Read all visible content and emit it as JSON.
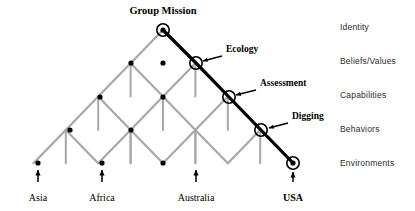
{
  "figure": {
    "type": "lattice-diagram",
    "title": "Group Mission",
    "colors": {
      "lattice": "#a8a8a8",
      "path": "#000000",
      "node": "#000000",
      "text": "#000000",
      "side_text": "#2b2b2b",
      "background": "#ffffff"
    }
  },
  "apex": {
    "label": "Group Mission",
    "x": 163,
    "y": 30
  },
  "levels": [
    {
      "name": "Identity",
      "y": 30
    },
    {
      "name": "Beliefs/Values",
      "y": 63
    },
    {
      "name": "Capabilities",
      "y": 97
    },
    {
      "name": "Behaviors",
      "y": 130
    },
    {
      "name": "Environments",
      "y": 163
    }
  ],
  "side_labels": [
    {
      "text": "Identity",
      "x": 340,
      "y": 22
    },
    {
      "text": "Beliefs/Values",
      "x": 340,
      "y": 56
    },
    {
      "text": "Capabilities",
      "x": 340,
      "y": 90
    },
    {
      "text": "Behaviors",
      "x": 340,
      "y": 124
    },
    {
      "text": "Environments",
      "x": 340,
      "y": 158
    }
  ],
  "bottom_labels": [
    {
      "text": "Asia",
      "x": 38,
      "y": 192,
      "bold": false,
      "arrow_x": 38,
      "arrow_top": 170,
      "arrow_bottom": 182
    },
    {
      "text": "Africa",
      "x": 102,
      "y": 192,
      "bold": false,
      "arrow_x": 102,
      "arrow_top": 170,
      "arrow_bottom": 182
    },
    {
      "text": "Australia",
      "x": 196,
      "y": 192,
      "bold": false,
      "arrow_x": 196,
      "arrow_top": 170,
      "arrow_bottom": 182
    },
    {
      "text": "USA",
      "x": 293,
      "y": 192,
      "bold": true,
      "arrow_x": 293,
      "arrow_top": 172,
      "arrow_bottom": 182
    }
  ],
  "path_nodes": [
    {
      "label": "Group Mission",
      "x": 163,
      "y": 30,
      "circled": true,
      "dot": true
    },
    {
      "label": "Ecology",
      "x": 196,
      "y": 63,
      "circled": true,
      "dot": false
    },
    {
      "label": "Assessment",
      "x": 229,
      "y": 97,
      "circled": true,
      "dot": false
    },
    {
      "label": "Digging",
      "x": 261,
      "y": 130,
      "circled": true,
      "dot": false
    },
    {
      "label": "USA",
      "x": 293,
      "y": 163,
      "circled": true,
      "dot": true
    }
  ],
  "annotations": [
    {
      "text": "Ecology",
      "text_x": 222,
      "text_y": 49,
      "tail_x": 222,
      "tail_y": 56,
      "head_x": 203,
      "head_y": 61
    },
    {
      "text": "Assessment",
      "text_x": 256,
      "text_y": 83,
      "tail_x": 256,
      "tail_y": 90,
      "head_x": 236,
      "head_y": 95
    },
    {
      "text": "Digging",
      "text_x": 288,
      "text_y": 116,
      "tail_x": 288,
      "tail_y": 123,
      "head_x": 269,
      "head_y": 128
    }
  ],
  "lattice_dots": [
    {
      "x": 38,
      "y": 163
    },
    {
      "x": 70,
      "y": 130
    },
    {
      "x": 102,
      "y": 163
    },
    {
      "x": 100,
      "y": 97
    },
    {
      "x": 131,
      "y": 130
    },
    {
      "x": 131,
      "y": 63
    },
    {
      "x": 163,
      "y": 97
    },
    {
      "x": 163,
      "y": 163
    },
    {
      "x": 163,
      "y": 63
    }
  ],
  "geometry": {
    "step_x": 32.4,
    "step_y": 33.3,
    "left_apex_x": 163,
    "bottom_y": 163,
    "top_y": 30
  }
}
